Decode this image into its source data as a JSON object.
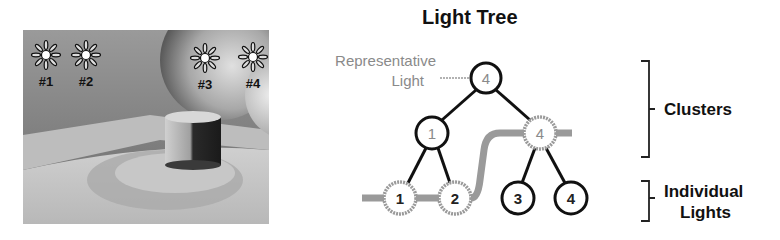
{
  "title": "Light Tree",
  "scene": {
    "lights": [
      {
        "label": "#1",
        "x": 46,
        "y": 55
      },
      {
        "label": "#2",
        "x": 86,
        "y": 55
      },
      {
        "label": "#3",
        "x": 205,
        "y": 58
      },
      {
        "label": "#4",
        "x": 253,
        "y": 57
      }
    ]
  },
  "tree": {
    "annotation": {
      "line1": "Representative",
      "line2": "Light"
    },
    "root": {
      "label": "4"
    },
    "clusters": [
      {
        "label": "1"
      },
      {
        "label": "4"
      }
    ],
    "leaves": [
      {
        "label": "1"
      },
      {
        "label": "2"
      },
      {
        "label": "3"
      },
      {
        "label": "4"
      }
    ]
  },
  "brackets": {
    "clusters_label": "Clusters",
    "individual_line1": "Individual",
    "individual_line2": "Lights"
  },
  "colors": {
    "line": "#111111",
    "highlight": "#9a9a9a",
    "rep_text": "#8a8a8a"
  }
}
